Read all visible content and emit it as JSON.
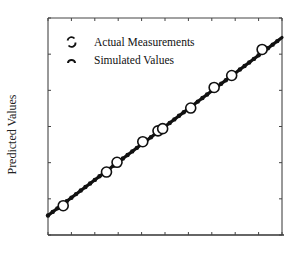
{
  "chart_data": {
    "type": "scatter",
    "title": "",
    "xlabel": "",
    "ylabel": "Predicted Values",
    "x_tick_labels": [],
    "y_tick_labels": [],
    "x_ticks_count": 11,
    "y_ticks_count": 7,
    "grid": false,
    "legend_position": "upper-left",
    "xlim": [
      0,
      1
    ],
    "ylim": [
      0,
      1
    ],
    "series": [
      {
        "name": "Actual Measurements",
        "marker": "open-circle",
        "points": [
          {
            "x": 0.065,
            "y": 0.135
          },
          {
            "x": 0.25,
            "y": 0.29
          },
          {
            "x": 0.295,
            "y": 0.335
          },
          {
            "x": 0.405,
            "y": 0.43
          },
          {
            "x": 0.47,
            "y": 0.48
          },
          {
            "x": 0.49,
            "y": 0.49
          },
          {
            "x": 0.61,
            "y": 0.585
          },
          {
            "x": 0.71,
            "y": 0.68
          },
          {
            "x": 0.785,
            "y": 0.735
          },
          {
            "x": 0.915,
            "y": 0.855
          }
        ]
      },
      {
        "name": "Simulated Values",
        "marker": "dense-filled-line",
        "points": [
          {
            "x": 0.0,
            "y": 0.09
          },
          {
            "x": 1.0,
            "y": 0.91
          }
        ]
      }
    ]
  },
  "legend": {
    "items": [
      {
        "label": "Actual Measurements"
      },
      {
        "label": "Simulated Values"
      }
    ]
  },
  "axes": {
    "ylabel": "Predicted Values"
  },
  "colors": {
    "line": "#111111",
    "axis": "#333333",
    "background": "#ffffff"
  }
}
